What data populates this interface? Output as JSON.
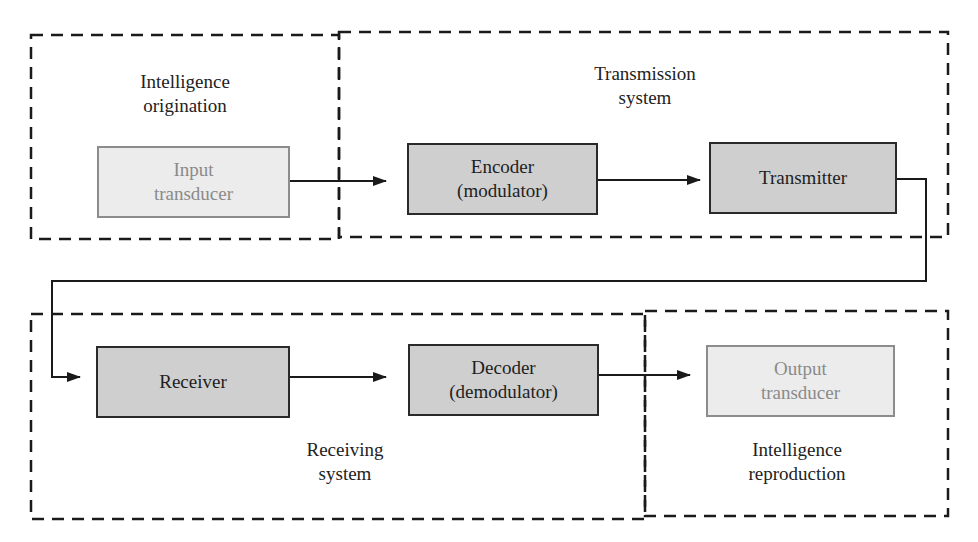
{
  "diagram": {
    "regions": [
      {
        "id": "intelligence-origination",
        "label": "Intelligence\norigination"
      },
      {
        "id": "transmission-system",
        "label": "Transmission\nsystem"
      },
      {
        "id": "receiving-system",
        "label": "Receiving\nsystem"
      },
      {
        "id": "intelligence-reproduction",
        "label": "Intelligence\nreproduction"
      }
    ],
    "blocks": [
      {
        "id": "input-transducer",
        "label": "Input\ntransducer",
        "style": "light"
      },
      {
        "id": "encoder",
        "label": "Encoder\n(modulator)",
        "style": "dark"
      },
      {
        "id": "transmitter",
        "label": "Transmitter",
        "style": "dark"
      },
      {
        "id": "receiver",
        "label": "Receiver",
        "style": "dark"
      },
      {
        "id": "decoder",
        "label": "Decoder\n(demodulator)",
        "style": "dark"
      },
      {
        "id": "output-transducer",
        "label": "Output\ntransducer",
        "style": "light"
      }
    ],
    "connections": [
      {
        "from": "input-transducer",
        "to": "encoder"
      },
      {
        "from": "encoder",
        "to": "transmitter"
      },
      {
        "from": "transmitter",
        "to": "receiver"
      },
      {
        "from": "receiver",
        "to": "decoder"
      },
      {
        "from": "decoder",
        "to": "output-transducer"
      }
    ],
    "colors": {
      "dark_block_fill": "#cfcfcf",
      "light_block_fill": "#ececec",
      "light_text": "#8a8a8a",
      "line": "#1a1a1a"
    }
  }
}
